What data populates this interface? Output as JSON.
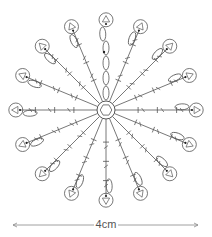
{
  "diagram": {
    "type": "crochet-chart",
    "center": {
      "x": 106,
      "y": 110,
      "ring_radius": 9
    },
    "spoke_count": 16,
    "spoke_length": 86,
    "top_spoke_style": "chain-ovals",
    "line_color": "#555555",
    "background": "#ffffff"
  },
  "scale_bar": {
    "label": "4cm",
    "x_start": 13,
    "x_end": 198,
    "y": 225
  }
}
